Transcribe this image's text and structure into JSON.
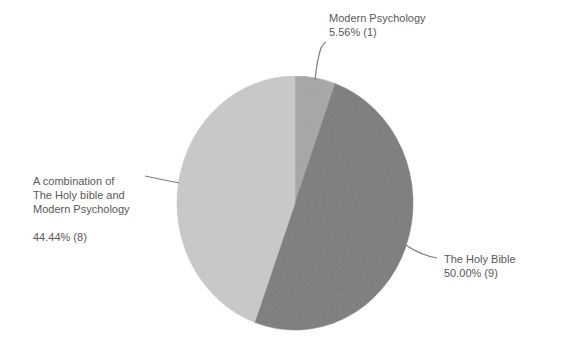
{
  "chart_data": {
    "type": "pie",
    "title": "",
    "start_angle_deg": 0,
    "direction": "clockwise",
    "legend": "none (data labels with leader lines)",
    "slices": [
      {
        "name": "Modern Psychology",
        "label_lines": [
          "Modern Psychology"
        ],
        "percent": 5.56,
        "percent_label": "5.56% (1)",
        "count": 1,
        "color": "#a6a6a6"
      },
      {
        "name": "The Holy Bible",
        "label_lines": [
          "The Holy Bible"
        ],
        "percent": 50.0,
        "percent_label": "50.00% (9)",
        "count": 9,
        "color": "#7b7b7b"
      },
      {
        "name": "A combination of The Holy bible and Modern Psychology",
        "label_lines": [
          "A combination of",
          "The Holy bible and",
          "Modern Psychology"
        ],
        "percent": 44.44,
        "percent_label": "44.44% (8)",
        "count": 8,
        "color": "#c9c9c9"
      }
    ],
    "categories": [
      "Modern Psychology",
      "The Holy Bible",
      "A combination of The Holy bible and Modern Psychology"
    ],
    "values": [
      1,
      9,
      8
    ]
  },
  "style": {
    "leader_color": "#7f7f7f",
    "text_color": "#595959"
  }
}
